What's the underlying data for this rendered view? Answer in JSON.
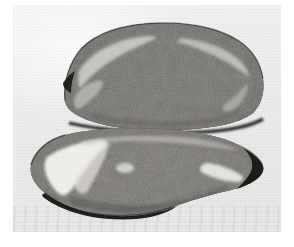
{
  "page": {
    "width_px": 294,
    "height_px": 247,
    "media_type": "scanned-halftone-photograph",
    "color_mode": "grayscale",
    "margin_color": "#ffffff",
    "has_text": false,
    "caption": "",
    "title": ""
  },
  "plate": {
    "left_px": 13,
    "top_px": 5,
    "width_px": 268,
    "height_px": 227,
    "background_color": "#ececec",
    "description": "Light gray photographic plate background with faint scan grain"
  },
  "specimen": {
    "name": "bisected-seed-longitudinal-section",
    "description": "Two stacked lens shaped halves of a sectioned seed or grain, each bounded by a dark rind, with speckled granular interior tissue",
    "orientation": "horizontal-long-axis",
    "halves": [
      {
        "id": "upper-half",
        "label": "Upper half",
        "shape": "elongated-lens",
        "rind_color": "#2e2b29",
        "interior_color": "#8c8a86",
        "features": [
          "thick dark rind along upper margin",
          "pale band inside upper-left margin",
          "pale band inside upper-right margin",
          "granular speckled endosperm interior",
          "blunt rounded left end"
        ]
      },
      {
        "id": "lower-half",
        "label": "Lower half",
        "shape": "broad-lens-with-pointed-right-tip",
        "rind_color": "#211f1e",
        "interior_color": "#918f8b",
        "features": [
          "very dark near black rind along lower margin",
          "bright white triangular void at lower left",
          "bright white streak near right tip",
          "granular speckled endosperm interior",
          "narrow pointed right tip"
        ]
      }
    ],
    "seam": {
      "name": "median-cleft",
      "label": "Median cleft between halves",
      "y_px": 127,
      "color": "#1f1d1c",
      "description": "Dark horizontal fissure separating the two halves"
    }
  },
  "palette": {
    "paper_white": "#ffffff",
    "plate_background": "#ececec",
    "rind_dark": "#2b2826",
    "rind_darkest": "#1a1918",
    "tissue_mid": "#8e8c88",
    "tissue_light": "#c9c7c2",
    "void_white": "#f6f5f3"
  }
}
